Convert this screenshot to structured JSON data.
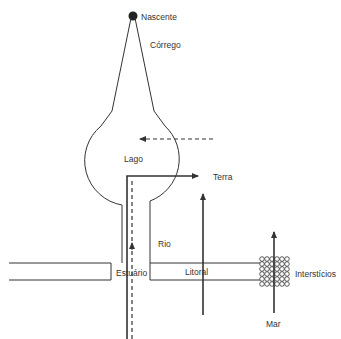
{
  "diagram": {
    "type": "hydrological-landscape-schematic",
    "colors": {
      "stroke": "#333333",
      "background": "#ffffff"
    },
    "labels": {
      "nascente": "Nascente",
      "corrego": "Córrego",
      "lago": "Lago",
      "terra": "Terra",
      "rio": "Rio",
      "estuario": "Estuário",
      "litoral": "Litoral",
      "intersticios": "Interstícios",
      "mar": "Mar"
    },
    "nodes": [
      {
        "id": "nascente",
        "label": "Nascente",
        "shape": "filled-dot"
      },
      {
        "id": "corrego",
        "label": "Córrego",
        "shape": "triangle-channel"
      },
      {
        "id": "lago",
        "label": "Lago",
        "shape": "circle-basin"
      },
      {
        "id": "rio",
        "label": "Rio",
        "shape": "channel"
      },
      {
        "id": "estuario",
        "label": "Estuário",
        "shape": "junction"
      },
      {
        "id": "litoral",
        "label": "Litoral",
        "shape": "channel"
      },
      {
        "id": "intersticios",
        "label": "Interstícios",
        "shape": "grain-grid-6x6"
      },
      {
        "id": "terra",
        "label": "Terra",
        "shape": "arrow-target"
      },
      {
        "id": "mar",
        "label": "Mar",
        "shape": "arrow-source"
      }
    ],
    "arrows": [
      {
        "from": "rio",
        "to": "terra",
        "style": "solid",
        "direction": "up-then-right"
      },
      {
        "from": "rio-mouth",
        "to": "lago",
        "style": "dashed",
        "direction": "up"
      },
      {
        "from": "right",
        "to": "lago",
        "style": "dashed",
        "direction": "left"
      },
      {
        "from": "litoral-below",
        "to": "up",
        "style": "solid",
        "direction": "up"
      },
      {
        "from": "mar",
        "to": "up",
        "style": "solid",
        "direction": "up",
        "through": "intersticios"
      }
    ]
  }
}
